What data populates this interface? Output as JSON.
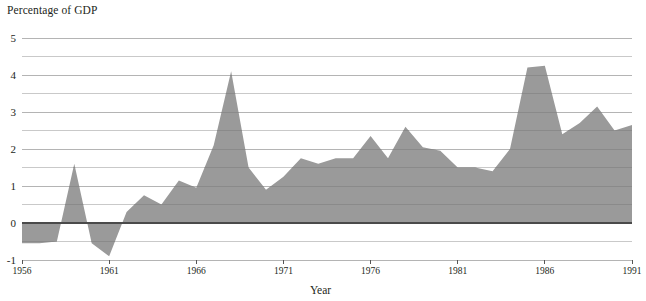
{
  "chart_data": {
    "type": "area",
    "title": "",
    "ylabel": "Percentage of GDP",
    "xlabel": "Year",
    "ylim": [
      -1,
      5
    ],
    "xlim": [
      1956,
      1991
    ],
    "grid": true,
    "legend": false,
    "series_color": "#9a9a9a",
    "gridline_color": "#c9c9c9",
    "zeroline_color": "#4a4a4a",
    "baseline": 0,
    "y_major_ticks": [
      -1,
      0,
      1,
      2,
      3,
      4,
      5
    ],
    "y_minor_ticks": [
      -0.5,
      0.5,
      1.5,
      2.5,
      3.5,
      4.5
    ],
    "y_tick_labels": [
      "-1",
      "0",
      "1",
      "2",
      "3",
      "4",
      "5"
    ],
    "x_ticks": [
      1956,
      1961,
      1966,
      1971,
      1976,
      1981,
      1986,
      1991
    ],
    "x_tick_labels": [
      "1956",
      "1961",
      "1966",
      "1971",
      "1976",
      "1981",
      "1986",
      "1991"
    ],
    "x": [
      1956,
      1957,
      1958,
      1959,
      1960,
      1961,
      1962,
      1963,
      1964,
      1965,
      1966,
      1967,
      1968,
      1969,
      1970,
      1971,
      1972,
      1973,
      1974,
      1975,
      1976,
      1977,
      1978,
      1979,
      1980,
      1981,
      1982,
      1983,
      1984,
      1985,
      1986,
      1987,
      1988,
      1989,
      1990,
      1991
    ],
    "values": [
      -0.55,
      -0.55,
      -0.5,
      1.6,
      -0.55,
      -0.9,
      0.3,
      0.75,
      0.5,
      1.15,
      0.95,
      2.1,
      4.1,
      1.5,
      0.9,
      1.25,
      1.75,
      1.6,
      1.75,
      1.75,
      2.35,
      1.75,
      2.6,
      2.05,
      1.95,
      1.5,
      1.5,
      1.4,
      2.0,
      4.2,
      4.25,
      2.4,
      2.7,
      3.15,
      2.5,
      2.65
    ],
    "categories": [
      "1956",
      "1957",
      "1958",
      "1959",
      "1960",
      "1961",
      "1962",
      "1963",
      "1964",
      "1965",
      "1966",
      "1967",
      "1968",
      "1969",
      "1970",
      "1971",
      "1972",
      "1973",
      "1974",
      "1975",
      "1976",
      "1977",
      "1978",
      "1979",
      "1980",
      "1981",
      "1982",
      "1983",
      "1984",
      "1985",
      "1986",
      "1987",
      "1988",
      "1989",
      "1990",
      "1991"
    ]
  },
  "geometry": {
    "plot_left": 22,
    "plot_right": 632,
    "y_top_px": 38,
    "y_bottom_px": 260,
    "px_per_unit": 37
  }
}
